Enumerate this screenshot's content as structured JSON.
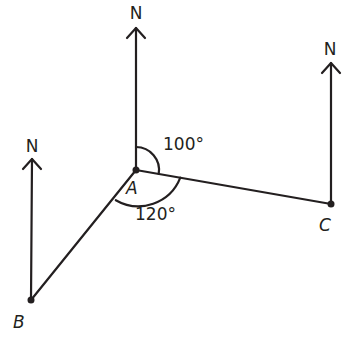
{
  "diagram": {
    "type": "bearing-diagram",
    "stroke_color": "#231f20",
    "background": "#ffffff",
    "points": [
      {
        "id": "A",
        "label": "A",
        "x": 136,
        "y": 170
      },
      {
        "id": "B",
        "label": "B",
        "x": 31,
        "y": 300
      },
      {
        "id": "C",
        "label": "C",
        "x": 331,
        "y": 204
      }
    ],
    "north_arrows": [
      {
        "at": "A",
        "label": "N"
      },
      {
        "at": "B",
        "label": "N"
      },
      {
        "at": "C",
        "label": "N"
      }
    ],
    "segments": [
      {
        "from": "A",
        "to": "B"
      },
      {
        "from": "A",
        "to": "C"
      }
    ],
    "angles": [
      {
        "id": "north-to-AC",
        "label": "100°",
        "from": "north",
        "to": "AC",
        "vertex": "A"
      },
      {
        "id": "AC-to-AB",
        "label": "120°",
        "from": "AC",
        "to": "AB",
        "vertex": "A"
      }
    ]
  }
}
